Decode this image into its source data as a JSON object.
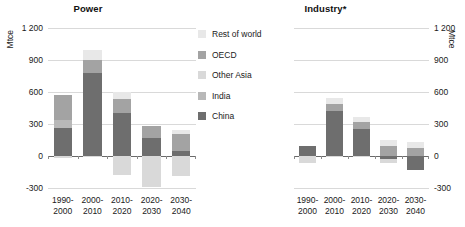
{
  "chart_data": {
    "type": "bar",
    "title": "",
    "subtype": "stacked-bar-diverging",
    "panels": [
      {
        "id": "power",
        "title": "Power",
        "ylabel": "Mtce",
        "axis_side": "left",
        "ylim": [
          -300,
          1200
        ],
        "yticks": [
          1200,
          900,
          600,
          300,
          0,
          -300
        ],
        "ytick_labels": [
          "1 200",
          "900",
          "600",
          "300",
          "0",
          "-300"
        ],
        "grid": true,
        "categories": [
          "1990-2000",
          "2000-2010",
          "2010-2020",
          "2020-2030",
          "2030-2040"
        ],
        "series": [
          {
            "name": "China",
            "values": [
              265,
              780,
              400,
              170,
              50
            ]
          },
          {
            "name": "India",
            "values": [
              75,
              0,
              0,
              0,
              0
            ]
          },
          {
            "name": "Other Asia",
            "values": [
              0,
              0,
              0,
              0,
              0
            ]
          },
          {
            "name": "OECD",
            "values": [
              235,
              120,
              130,
              115,
              155
            ]
          },
          {
            "name": "Rest of world",
            "values": [
              0,
              90,
              70,
              0,
              40
            ]
          }
        ],
        "negative_series": [
          {
            "name": "India",
            "values": [
              0,
              0,
              0,
              0,
              0
            ]
          },
          {
            "name": "Other Asia",
            "values": [
              -20,
              -10,
              -180,
              -290,
              -185
            ]
          }
        ],
        "bar_totals_positive": [
          575,
          990,
          600,
          285,
          245
        ],
        "bar_totals_negative": [
          -20,
          -10,
          -180,
          -290,
          -185
        ]
      },
      {
        "id": "industry",
        "title": "Industry*",
        "ylabel": "Mtce",
        "axis_side": "right",
        "ylim": [
          -300,
          1200
        ],
        "yticks": [
          1200,
          900,
          600,
          300,
          0,
          -300
        ],
        "ytick_labels": [
          "1 200",
          "900",
          "600",
          "300",
          "0",
          "-300"
        ],
        "grid": true,
        "categories": [
          "1990-2000",
          "2000-2010",
          "2010-2020",
          "2020-2030",
          "2030-2040"
        ],
        "series": [
          {
            "name": "China",
            "values": [
              90,
              420,
              255,
              0,
              0
            ]
          },
          {
            "name": "India",
            "values": [
              0,
              0,
              0,
              0,
              0
            ]
          },
          {
            "name": "Other Asia",
            "values": [
              0,
              0,
              0,
              0,
              0
            ]
          },
          {
            "name": "OECD",
            "values": [
              0,
              70,
              60,
              95,
              75
            ]
          },
          {
            "name": "Rest of world",
            "values": [
              0,
              50,
              55,
              55,
              55
            ]
          }
        ],
        "negative_series": [
          {
            "name": "China",
            "values": [
              0,
              0,
              0,
              -30,
              -135
            ]
          },
          {
            "name": "Other Asia",
            "values": [
              -65,
              -10,
              -10,
              -35,
              0
            ]
          }
        ],
        "bar_totals_positive": [
          90,
          540,
          370,
          150,
          130
        ],
        "bar_totals_negative": [
          -65,
          -10,
          -10,
          -65,
          -135
        ]
      }
    ],
    "legend": {
      "position": "center",
      "entries": [
        {
          "label": "Rest of world",
          "color": "#e8e8e8"
        },
        {
          "label": "OECD",
          "color": "#a3a3a3"
        },
        {
          "label": "Other Asia",
          "color": "#d9d9d9"
        },
        {
          "label": "India",
          "color": "#b8b8b8"
        },
        {
          "label": "China",
          "color": "#6e6e6e"
        }
      ]
    },
    "colors": {
      "china": "#6e6e6e",
      "india": "#b8b8b8",
      "other_asia": "#d9d9d9",
      "oecd": "#a3a3a3",
      "rest_of_world": "#e8e8e8",
      "gridline": "#d9d9d9",
      "zeroline": "#6a6a6a",
      "text": "#1a1a1a"
    }
  }
}
